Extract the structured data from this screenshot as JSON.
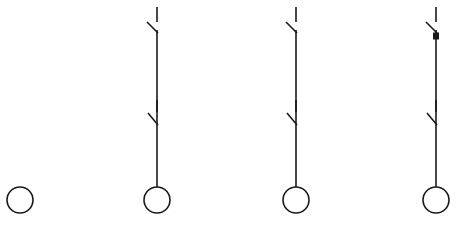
{
  "diagram": {
    "type": "schematic",
    "background_color": "#ffffff",
    "stroke_color": "#1a1a1a",
    "canvas": {
      "width": 460,
      "height": 226
    },
    "figures": [
      {
        "id": "figure-1",
        "label": "circle only",
        "center_x": 20,
        "has_vertical_line": false,
        "switches": [],
        "terminal_dot": null,
        "circle": {
          "cx": 20,
          "cy": 200,
          "r": 13
        }
      },
      {
        "id": "figure-2",
        "label": "two open switches with lamp",
        "center_x": 157,
        "has_vertical_line": true,
        "line_top_y": 30,
        "line_bottom_y": 187,
        "switches": [
          {
            "name": "upper-switch",
            "stub_x": 157,
            "stub_top_y": 7,
            "stub_bottom_y": 22,
            "blade_x1": 147,
            "blade_y1": 22,
            "blade_x2": 158,
            "blade_y2": 33
          },
          {
            "name": "lower-switch",
            "stub_x": 157,
            "stub_top_y": 100,
            "stub_bottom_y": 112,
            "blade_x1": 148,
            "blade_y1": 113,
            "blade_x2": 158,
            "blade_y2": 125
          }
        ],
        "terminal_dot": null,
        "circle": {
          "cx": 157,
          "cy": 200,
          "r": 13
        }
      },
      {
        "id": "figure-3",
        "label": "two open switches with lamp",
        "center_x": 296,
        "has_vertical_line": true,
        "line_top_y": 30,
        "line_bottom_y": 187,
        "switches": [
          {
            "name": "upper-switch",
            "stub_x": 296,
            "stub_top_y": 7,
            "stub_bottom_y": 22,
            "blade_x1": 286,
            "blade_y1": 22,
            "blade_x2": 297,
            "blade_y2": 33
          },
          {
            "name": "lower-switch",
            "stub_x": 296,
            "stub_top_y": 100,
            "stub_bottom_y": 112,
            "blade_x1": 287,
            "blade_y1": 113,
            "blade_x2": 297,
            "blade_y2": 125
          }
        ],
        "terminal_dot": null,
        "circle": {
          "cx": 296,
          "cy": 200,
          "r": 13
        }
      },
      {
        "id": "figure-4",
        "label": "two open switches with terminal dot and lamp",
        "center_x": 436,
        "has_vertical_line": true,
        "line_top_y": 30,
        "line_bottom_y": 187,
        "switches": [
          {
            "name": "upper-switch",
            "stub_x": 436,
            "stub_top_y": 7,
            "stub_bottom_y": 22,
            "blade_x1": 426,
            "blade_y1": 22,
            "blade_x2": 437,
            "blade_y2": 33
          },
          {
            "name": "lower-switch",
            "stub_x": 436,
            "stub_top_y": 100,
            "stub_bottom_y": 112,
            "blade_x1": 427,
            "blade_y1": 113,
            "blade_x2": 437,
            "blade_y2": 125
          }
        ],
        "terminal_dot": {
          "cx": 436,
          "cy": 36,
          "w": 6,
          "h": 7
        },
        "circle": {
          "cx": 436,
          "cy": 200,
          "r": 13
        }
      }
    ]
  }
}
